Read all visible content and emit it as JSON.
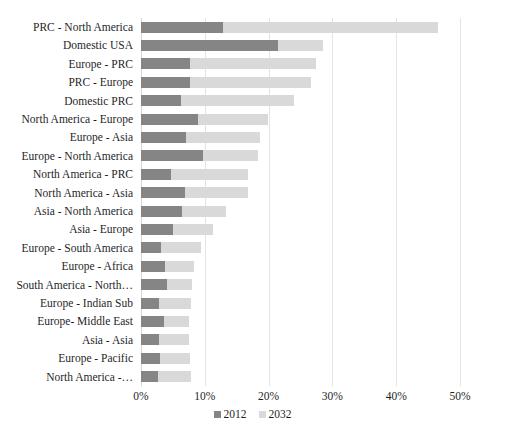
{
  "chart_data": {
    "type": "bar",
    "orientation": "horizontal",
    "stacked": true,
    "title": "",
    "xlabel": "",
    "ylabel": "",
    "xlim": [
      0,
      50
    ],
    "xunit": "%",
    "grid": true,
    "legend_position": "bottom",
    "xticks": [
      "0%",
      "10%",
      "20%",
      "30%",
      "40%",
      "50%"
    ],
    "xtick_values": [
      0,
      10,
      20,
      30,
      40,
      50
    ],
    "categories": [
      "PRC - North America",
      "Domestic USA",
      "Europe - PRC",
      "PRC - Europe",
      "Domestic PRC",
      "North America - Europe",
      "Europe - Asia",
      "Europe - North America",
      "North America - PRC",
      "North America - Asia",
      "Asia - North America",
      "Asia - Europe",
      "Europe - South America",
      "Europe - Africa",
      "South America - North…",
      "Europe - Indian Sub",
      "Europe- Middle East",
      "Asia - Asia",
      "Europe - Pacific",
      "North America -…"
    ],
    "series": [
      {
        "name": "2012",
        "color": "#858585",
        "values": [
          12.9,
          21.4,
          7.7,
          7.7,
          6.3,
          9.0,
          7.1,
          9.7,
          4.7,
          6.9,
          6.4,
          5.0,
          3.1,
          3.8,
          4.0,
          2.8,
          3.6,
          2.8,
          3.0,
          2.7
        ]
      },
      {
        "name": "2032",
        "color": "#d9d9d9",
        "values": [
          33.6,
          7.1,
          19.8,
          18.9,
          17.7,
          10.9,
          11.5,
          8.7,
          12.1,
          9.8,
          7.0,
          6.3,
          6.3,
          4.5,
          4.0,
          5.0,
          3.9,
          4.7,
          4.7,
          5.1
        ]
      }
    ],
    "totals": [
      46.5,
      28.5,
      27.5,
      26.6,
      24.0,
      19.9,
      18.6,
      18.4,
      16.8,
      16.7,
      13.4,
      11.3,
      9.4,
      8.3,
      8.0,
      7.8,
      7.5,
      7.5,
      7.7,
      7.8
    ]
  },
  "legend": {
    "items": [
      {
        "label": "2012",
        "color": "#858585"
      },
      {
        "label": "2032",
        "color": "#d9d9d9"
      }
    ]
  },
  "colors": {
    "series_2012": "#858585",
    "series_2032": "#d9d9d9",
    "gridline": "#e4e4e4",
    "background": "#ffffff",
    "text": "#1f1f1f"
  }
}
